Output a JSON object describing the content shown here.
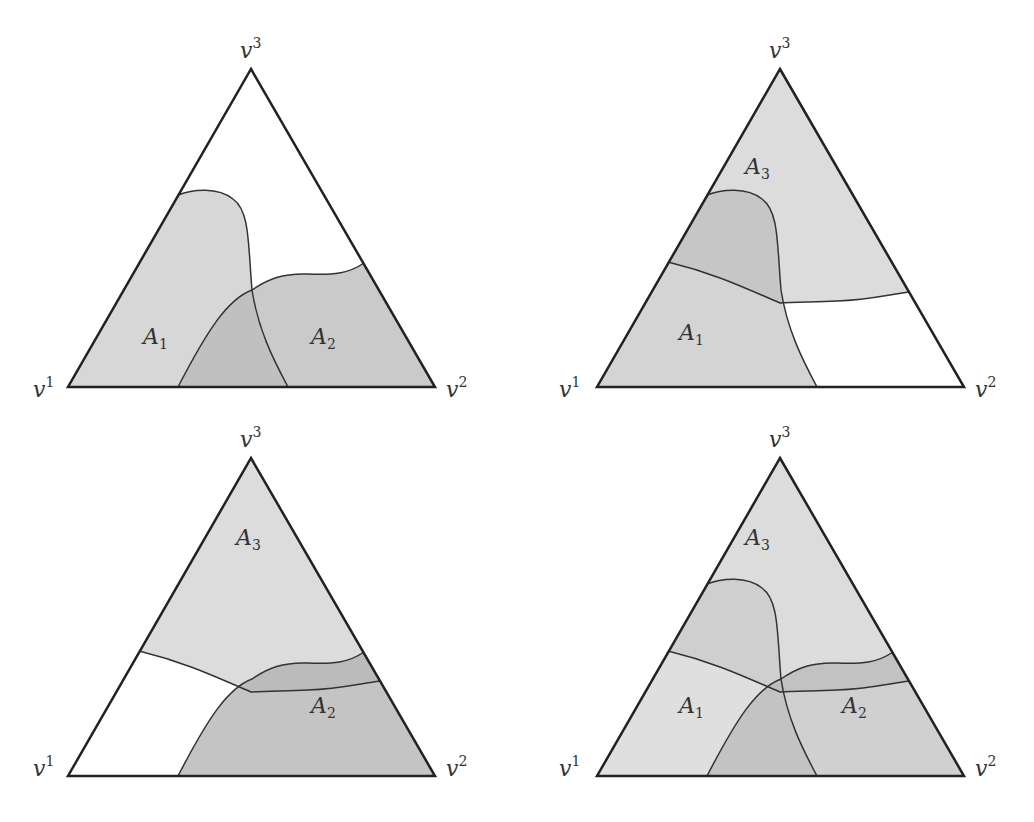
{
  "colors": {
    "region_light": "#d9d9d9",
    "region_mid": "#bdbdbd",
    "region_dark": "#a6a6a6",
    "outline": "#222222",
    "background": "#ffffff"
  },
  "vertices": {
    "v1": {
      "base": "v",
      "sup": "1"
    },
    "v2": {
      "base": "v",
      "sup": "2"
    },
    "v3": {
      "base": "v",
      "sup": "3"
    }
  },
  "regions": {
    "A1": {
      "base": "A",
      "sub": "1"
    },
    "A2": {
      "base": "A",
      "sub": "2"
    },
    "A3": {
      "base": "A",
      "sub": "3"
    }
  },
  "panels": [
    {
      "position": "top-left",
      "regions_shown": [
        "A1",
        "A2"
      ]
    },
    {
      "position": "top-right",
      "regions_shown": [
        "A1",
        "A3"
      ]
    },
    {
      "position": "bottom-left",
      "regions_shown": [
        "A2",
        "A3"
      ]
    },
    {
      "position": "bottom-right",
      "regions_shown": [
        "A1",
        "A2",
        "A3"
      ]
    }
  ]
}
